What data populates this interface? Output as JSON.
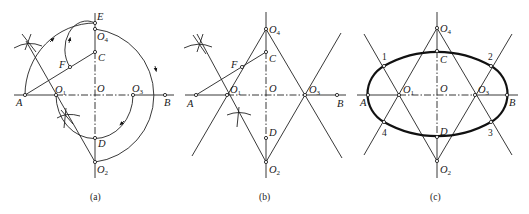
{
  "figure": {
    "panels": [
      {
        "id": "a",
        "caption": "(a)",
        "points": {
          "E": "E",
          "O4": "O",
          "O4_sub": "4",
          "C": "C",
          "F": "F",
          "A": "A",
          "O1": "O",
          "O1_sub": "1",
          "O": "O",
          "O3": "O",
          "O3_sub": "3",
          "B": "B",
          "D": "D",
          "O2": "O",
          "O2_sub": "2"
        }
      },
      {
        "id": "b",
        "caption": "(b)",
        "points": {
          "O4": "O",
          "O4_sub": "4",
          "C": "C",
          "F": "F",
          "A": "A",
          "O1": "O",
          "O1_sub": "1",
          "O": "O",
          "O3": "O",
          "O3_sub": "3",
          "B": "B",
          "D": "D",
          "O2": "O",
          "O2_sub": "2"
        }
      },
      {
        "id": "c",
        "caption": "(c)",
        "points": {
          "O4": "O",
          "O4_sub": "4",
          "C": "C",
          "A": "A",
          "O1": "O",
          "O1_sub": "1",
          "O": "O",
          "O3": "O",
          "O3_sub": "3",
          "B": "B",
          "D": "D",
          "O2": "O",
          "O2_sub": "2",
          "p1": "1",
          "p2": "2",
          "p3": "3",
          "p4": "4"
        }
      }
    ]
  }
}
